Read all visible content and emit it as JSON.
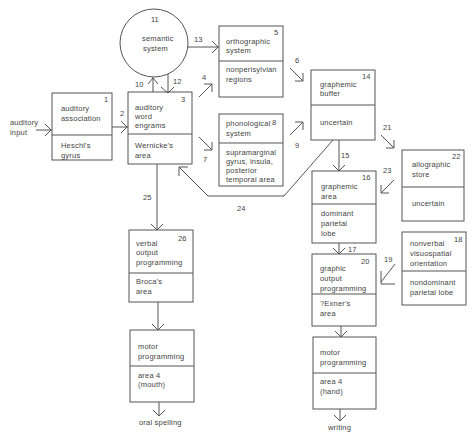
{
  "diagram": {
    "inputs": {
      "auditory_input": [
        "auditory",
        "input"
      ]
    },
    "outputs": {
      "oral_spelling": "oral  spelling",
      "writing": "writing"
    },
    "nodes": {
      "semantic": {
        "num": "11",
        "lines": [
          "semantic",
          "system"
        ]
      },
      "auditory_assoc": {
        "num": "1",
        "top": [
          "auditory",
          "association"
        ],
        "bottom": [
          "Heschl's",
          "gyrus"
        ]
      },
      "auditory_word": {
        "num": "3",
        "top": [
          "auditory",
          "word",
          "engrams"
        ],
        "bottom": [
          "Wernicke's",
          "area"
        ]
      },
      "orthographic": {
        "num": "5",
        "top": [
          "orthographic",
          "system"
        ],
        "bottom": [
          "nonperisylvian",
          "regions"
        ]
      },
      "phonological": {
        "num": "8",
        "top": [
          "phonological",
          "system"
        ],
        "bottom": [
          "supramarginal",
          "gyrus,  insula,",
          "posterior",
          "temporal  area"
        ]
      },
      "graphemic_buffer": {
        "num": "14",
        "top": [
          "graphemic",
          "buffer"
        ],
        "bottom": [
          "uncertain"
        ]
      },
      "allographic": {
        "num": "22",
        "top": [
          "allographic",
          "store"
        ],
        "bottom": [
          "uncertain"
        ]
      },
      "graphemic_area": {
        "num": "16",
        "top": [
          "graphemic",
          "area"
        ],
        "bottom": [
          "dominant",
          "parietal",
          "lobe"
        ]
      },
      "nonverbal": {
        "num": "18",
        "top": [
          "nonverbal",
          "visuospatial",
          "orientation"
        ],
        "bottom": [
          "nondominant",
          "parietal  lobe"
        ]
      },
      "graphic_output": {
        "num": "20",
        "top": [
          "graphic",
          "output",
          "programming"
        ],
        "bottom": [
          "?Exner's",
          "area"
        ]
      },
      "verbal_output": {
        "num": "26",
        "top": [
          "verbal",
          "output",
          "programming"
        ],
        "bottom": [
          "Broca's",
          "area"
        ]
      },
      "motor_mouth": {
        "num": "",
        "top": [
          "motor",
          "programming"
        ],
        "bottom": [
          "area  4",
          "(mouth)"
        ]
      },
      "motor_hand": {
        "num": "",
        "top": [
          "motor",
          "programming"
        ],
        "bottom": [
          "area  4",
          "(hand)"
        ]
      }
    },
    "edge_labels": {
      "e2": "2",
      "e4": "4",
      "e6": "6",
      "e7": "7",
      "e9": "9",
      "e10": "10",
      "e12": "12",
      "e13": "13",
      "e15": "15",
      "e17": "17",
      "e19": "19",
      "e21": "21",
      "e23": "23",
      "e24": "24",
      "e25": "25"
    }
  }
}
